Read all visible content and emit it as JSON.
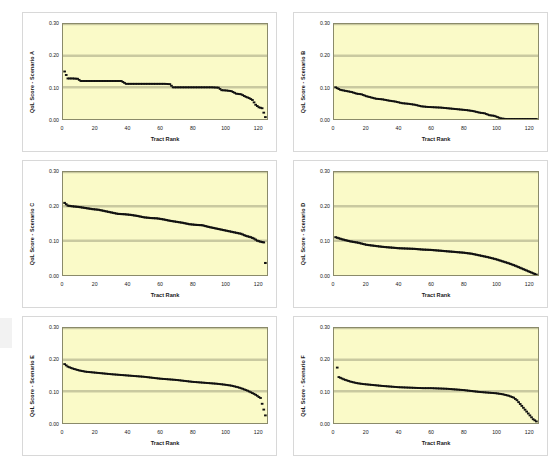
{
  "figure": {
    "background": "#ffffff",
    "plot_background": "#fafac8",
    "series_color": "#111111",
    "panel_border": "#d8d8d8"
  },
  "panels": [
    {
      "id": "A",
      "ylabel": "QoL Score - Scenario A"
    },
    {
      "id": "B",
      "ylabel": "QoL Score - Scenario B"
    },
    {
      "id": "C",
      "ylabel": "QoL Score - Scenario C"
    },
    {
      "id": "D",
      "ylabel": "QoL Score - Scenario D"
    },
    {
      "id": "E",
      "ylabel": "QoL Score - Scenario E"
    },
    {
      "id": "F",
      "ylabel": "QoL Score - Scenario F"
    }
  ],
  "axis": {
    "xlabel": "Tract Rank",
    "xticks": [
      "0",
      "20",
      "40",
      "60",
      "80",
      "100",
      "120"
    ],
    "yticks": [
      "0.00",
      "0.10",
      "0.20",
      "0.30"
    ]
  },
  "chart_data": [
    {
      "type": "scatter",
      "title": "",
      "xlabel": "Tract Rank",
      "ylabel": "QoL Score - Scenario A",
      "xlim": [
        0,
        126
      ],
      "ylim": [
        0.0,
        0.3
      ],
      "yticks": [
        0.0,
        0.1,
        0.2,
        0.3
      ],
      "xticks": [
        0,
        20,
        40,
        60,
        80,
        100,
        120
      ],
      "grid": "horizontal",
      "legend": "none",
      "note": "Descending step profile; sorted QoL scores by tract rank",
      "x": [
        1,
        3,
        6,
        9,
        11,
        14,
        18,
        22,
        26,
        30,
        34,
        36,
        39,
        43,
        47,
        51,
        55,
        59,
        63,
        66,
        68,
        72,
        76,
        80,
        84,
        88,
        92,
        96,
        98,
        101,
        104,
        107,
        110,
        113,
        115,
        117,
        119,
        121,
        123,
        125
      ],
      "y": [
        0.15,
        0.128,
        0.128,
        0.127,
        0.12,
        0.12,
        0.12,
        0.12,
        0.12,
        0.12,
        0.12,
        0.12,
        0.111,
        0.111,
        0.111,
        0.111,
        0.111,
        0.111,
        0.111,
        0.11,
        0.1,
        0.1,
        0.1,
        0.1,
        0.1,
        0.1,
        0.1,
        0.099,
        0.091,
        0.09,
        0.088,
        0.08,
        0.078,
        0.07,
        0.066,
        0.06,
        0.045,
        0.037,
        0.034,
        0.006
      ]
    },
    {
      "type": "scatter",
      "title": "",
      "xlabel": "Tract Rank",
      "ylabel": "QoL Score - Scenario B",
      "xlim": [
        0,
        126
      ],
      "ylim": [
        0.0,
        0.3
      ],
      "yticks": [
        0.0,
        0.1,
        0.2,
        0.3
      ],
      "xticks": [
        0,
        20,
        40,
        60,
        80,
        100,
        120
      ],
      "grid": "horizontal",
      "legend": "none",
      "note": "Step decline from 0.10 reaching 0.00 near rank 103, then flat at zero",
      "x": [
        1,
        4,
        8,
        11,
        14,
        17,
        20,
        23,
        26,
        30,
        34,
        38,
        42,
        46,
        50,
        54,
        58,
        62,
        66,
        70,
        74,
        78,
        82,
        86,
        90,
        93,
        96,
        99,
        101,
        103,
        106,
        110,
        114,
        118,
        122,
        125
      ],
      "y": [
        0.1,
        0.092,
        0.088,
        0.085,
        0.08,
        0.078,
        0.072,
        0.068,
        0.064,
        0.062,
        0.058,
        0.055,
        0.05,
        0.048,
        0.045,
        0.04,
        0.038,
        0.037,
        0.036,
        0.034,
        0.032,
        0.03,
        0.028,
        0.025,
        0.02,
        0.018,
        0.012,
        0.01,
        0.006,
        0.002,
        0.0,
        0.0,
        0.0,
        0.0,
        0.0,
        0.0
      ]
    },
    {
      "type": "scatter",
      "title": "",
      "xlabel": "Tract Rank",
      "ylabel": "QoL Score - Scenario C",
      "xlim": [
        0,
        126
      ],
      "ylim": [
        0.0,
        0.3
      ],
      "yticks": [
        0.0,
        0.1,
        0.2,
        0.3
      ],
      "xticks": [
        0,
        20,
        40,
        60,
        80,
        100,
        120
      ],
      "grid": "horizontal",
      "legend": "none",
      "note": "Highest starting values ~0.21, gradual step decline to ~0.095, lone low outlier at final rank",
      "x": [
        1,
        3,
        6,
        10,
        14,
        18,
        22,
        26,
        30,
        34,
        38,
        42,
        46,
        50,
        54,
        58,
        62,
        66,
        70,
        74,
        78,
        82,
        86,
        90,
        94,
        98,
        102,
        106,
        110,
        113,
        116,
        118,
        120,
        122,
        124,
        125
      ],
      "y": [
        0.21,
        0.202,
        0.2,
        0.198,
        0.195,
        0.192,
        0.19,
        0.186,
        0.182,
        0.178,
        0.177,
        0.175,
        0.172,
        0.168,
        0.166,
        0.165,
        0.162,
        0.158,
        0.155,
        0.152,
        0.148,
        0.146,
        0.145,
        0.14,
        0.136,
        0.132,
        0.128,
        0.124,
        0.12,
        0.114,
        0.11,
        0.106,
        0.1,
        0.097,
        0.095,
        0.035
      ]
    },
    {
      "type": "scatter",
      "title": "",
      "xlabel": "Tract Rank",
      "ylabel": "QoL Score - Scenario D",
      "xlim": [
        0,
        126
      ],
      "ylim": [
        0.0,
        0.3
      ],
      "yticks": [
        0.0,
        0.1,
        0.2,
        0.3
      ],
      "xticks": [
        0,
        20,
        40,
        60,
        80,
        100,
        120
      ],
      "grid": "horizontal",
      "legend": "none",
      "note": "Smooth continuous decline from 0.11 to 0.00 at the last rank",
      "x": [
        1,
        5,
        10,
        15,
        20,
        25,
        30,
        35,
        40,
        45,
        50,
        55,
        60,
        65,
        70,
        75,
        80,
        85,
        90,
        95,
        100,
        104,
        108,
        112,
        115,
        118,
        120,
        122,
        124,
        125
      ],
      "y": [
        0.11,
        0.104,
        0.098,
        0.094,
        0.088,
        0.085,
        0.082,
        0.08,
        0.078,
        0.077,
        0.076,
        0.074,
        0.073,
        0.071,
        0.069,
        0.067,
        0.065,
        0.062,
        0.057,
        0.052,
        0.046,
        0.04,
        0.034,
        0.027,
        0.021,
        0.015,
        0.011,
        0.007,
        0.003,
        0.001
      ]
    },
    {
      "type": "scatter",
      "title": "",
      "xlabel": "Tract Rank",
      "ylabel": "QoL Score - Scenario E",
      "xlim": [
        0,
        126
      ],
      "ylim": [
        0.0,
        0.3
      ],
      "yticks": [
        0.0,
        0.1,
        0.2,
        0.3
      ],
      "xticks": [
        0,
        20,
        40,
        60,
        80,
        100,
        120
      ],
      "grid": "horizontal",
      "legend": "none",
      "note": "Gentle decline from ~0.185 to ~0.08 with sharp drop after rank 115 and a low outlier at the end",
      "x": [
        1,
        3,
        6,
        10,
        14,
        18,
        22,
        26,
        30,
        35,
        40,
        45,
        50,
        55,
        60,
        65,
        70,
        75,
        80,
        85,
        90,
        95,
        100,
        104,
        108,
        111,
        114,
        116,
        118,
        120,
        121,
        122,
        125
      ],
      "y": [
        0.186,
        0.178,
        0.172,
        0.166,
        0.162,
        0.16,
        0.158,
        0.156,
        0.154,
        0.152,
        0.15,
        0.148,
        0.146,
        0.143,
        0.14,
        0.138,
        0.136,
        0.133,
        0.13,
        0.128,
        0.126,
        0.124,
        0.121,
        0.118,
        0.113,
        0.108,
        0.102,
        0.097,
        0.092,
        0.086,
        0.082,
        0.079,
        0.024
      ]
    },
    {
      "type": "scatter",
      "title": "",
      "xlabel": "Tract Rank",
      "ylabel": "QoL Score - Scenario F",
      "xlim": [
        0,
        126
      ],
      "ylim": [
        0.0,
        0.3
      ],
      "yticks": [
        0.0,
        0.1,
        0.2,
        0.3
      ],
      "xticks": [
        0,
        20,
        40,
        60,
        80,
        100,
        120
      ],
      "grid": "horizontal",
      "legend": "none",
      "note": "High isolated outlier near 0.175 at rank 2; main curve descends from 0.145 to near 0.005",
      "x": [
        2,
        3,
        6,
        10,
        14,
        18,
        22,
        26,
        30,
        35,
        40,
        45,
        50,
        55,
        60,
        65,
        70,
        75,
        80,
        85,
        90,
        95,
        100,
        104,
        108,
        111,
        113,
        115,
        117,
        119,
        121,
        123,
        125
      ],
      "y": [
        0.175,
        0.145,
        0.138,
        0.131,
        0.126,
        0.123,
        0.121,
        0.119,
        0.117,
        0.115,
        0.113,
        0.112,
        0.111,
        0.11,
        0.11,
        0.109,
        0.108,
        0.106,
        0.104,
        0.101,
        0.098,
        0.096,
        0.094,
        0.091,
        0.086,
        0.08,
        0.072,
        0.06,
        0.048,
        0.036,
        0.024,
        0.012,
        0.005
      ]
    }
  ]
}
